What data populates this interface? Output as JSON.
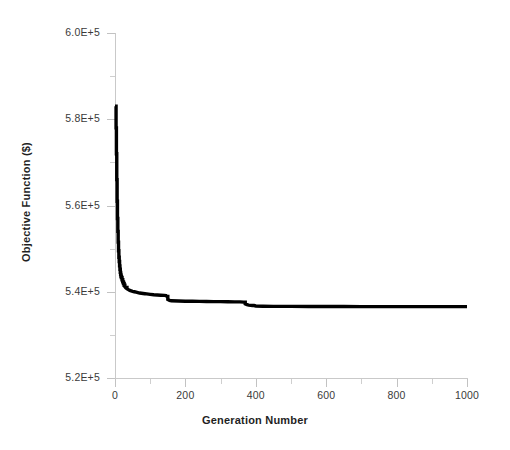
{
  "chart_data": {
    "type": "line",
    "title": "",
    "xlabel": "Generation Number",
    "ylabel": "Objective Function ($)",
    "xlim": [
      0,
      1000
    ],
    "ylim": [
      520000,
      600000
    ],
    "grid": false,
    "legend": null,
    "x_ticks": [
      0,
      200,
      400,
      600,
      800,
      1000
    ],
    "x_tick_labels": [
      "0",
      "200",
      "400",
      "600",
      "800",
      "1000"
    ],
    "x_minor_ticks": [
      100,
      300,
      500,
      700,
      900
    ],
    "y_ticks": [
      520000,
      540000,
      560000,
      580000,
      600000
    ],
    "y_tick_labels": [
      "5.2E+5",
      "5.4E+5",
      "5.6E+5",
      "5.8E+5",
      "6.0E+5"
    ],
    "y_minor_ticks": [
      530000,
      550000,
      570000,
      590000
    ],
    "series": [
      {
        "name": "Best objective function value",
        "color": "#000000",
        "line_width": 3.4,
        "x": [
          0,
          2,
          3,
          4,
          5,
          6,
          7,
          8,
          9,
          10,
          11,
          12,
          13,
          14,
          15,
          16,
          17,
          18,
          20,
          22,
          24,
          26,
          28,
          30,
          34,
          38,
          42,
          46,
          50,
          55,
          60,
          65,
          70,
          75,
          80,
          85,
          90,
          95,
          100,
          110,
          120,
          130,
          140,
          145,
          148,
          150,
          155,
          160,
          180,
          200,
          220,
          240,
          260,
          280,
          300,
          320,
          340,
          355,
          365,
          370,
          375,
          380,
          385,
          390,
          395,
          400,
          420,
          450,
          500,
          550,
          600,
          650,
          700,
          750,
          800,
          850,
          900,
          950,
          1000
        ],
        "y": [
          583000,
          583000,
          578000,
          572000,
          566000,
          561000,
          557000,
          554000,
          551500,
          549500,
          548000,
          547000,
          546000,
          545200,
          544500,
          544000,
          543600,
          543300,
          542800,
          542300,
          541900,
          541500,
          541200,
          541000,
          540700,
          540500,
          540300,
          540200,
          540100,
          540000,
          539900,
          539800,
          539700,
          539650,
          539600,
          539550,
          539500,
          539450,
          539400,
          539300,
          539250,
          539200,
          539150,
          539100,
          538900,
          538200,
          538000,
          537900,
          537850,
          537800,
          537780,
          537760,
          537740,
          537720,
          537700,
          537680,
          537660,
          537650,
          537600,
          537200,
          537000,
          536900,
          536850,
          536820,
          536800,
          536700,
          536650,
          536620,
          536600,
          536590,
          536580,
          536570,
          536560,
          536555,
          536550,
          536548,
          536546,
          536544,
          536542
        ]
      }
    ],
    "annotations": [
      {
        "label": "initial value",
        "x": 0,
        "y": 583000
      },
      {
        "label": "final converged value",
        "x": 1000,
        "y": 536542
      }
    ]
  },
  "axes": {
    "x_title": "Generation Number",
    "y_title": "Objective Function ($)"
  }
}
